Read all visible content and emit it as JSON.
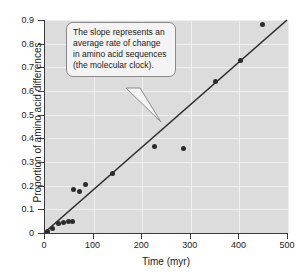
{
  "chart_data": {
    "type": "scatter",
    "title": "",
    "xlabel": "Time (myr)",
    "ylabel": "Proportion of amino acid differences",
    "xlim": [
      0,
      500
    ],
    "ylim": [
      0,
      0.9
    ],
    "grid": true,
    "legend": "none",
    "x_ticks": [
      "0",
      "100",
      "200",
      "300",
      "400",
      "500"
    ],
    "x_tick_values": [
      0,
      100,
      200,
      300,
      400,
      500
    ],
    "y_ticks": [
      "0",
      "0.1",
      "0.2",
      "0.3",
      "0.4",
      "0.5",
      "0.6",
      "0.7",
      "0.8",
      "0.9"
    ],
    "y_tick_values": [
      0,
      0.1,
      0.2,
      0.3,
      0.4,
      0.5,
      0.6,
      0.7,
      0.8,
      0.9
    ],
    "points": [
      {
        "x": 8,
        "y": 0.008
      },
      {
        "x": 18,
        "y": 0.02
      },
      {
        "x": 30,
        "y": 0.04
      },
      {
        "x": 41,
        "y": 0.046
      },
      {
        "x": 51,
        "y": 0.05
      },
      {
        "x": 58,
        "y": 0.05
      },
      {
        "x": 60,
        "y": 0.185
      },
      {
        "x": 73,
        "y": 0.175
      },
      {
        "x": 85,
        "y": 0.205
      },
      {
        "x": 140,
        "y": 0.25
      },
      {
        "x": 228,
        "y": 0.365
      },
      {
        "x": 287,
        "y": 0.357
      },
      {
        "x": 353,
        "y": 0.642
      },
      {
        "x": 405,
        "y": 0.73
      },
      {
        "x": 450,
        "y": 0.882
      }
    ],
    "trendline": {
      "label": "molecular clock regression line",
      "x_start": 0,
      "y_start": 0.0,
      "x_end": 500,
      "y_end": 0.9,
      "slope": 0.0018,
      "intercept": 0.0
    },
    "annotations": [
      {
        "name": "slope-callout",
        "text": "The slope represents an average rate of change in amino acid sequences (the molecular clock).",
        "points_to_x": 240,
        "points_to_y": 0.43
      }
    ],
    "colors": {
      "plot_background": "#dcdcdc",
      "gridline": "#f0f0f0",
      "point": "#2b2b2b",
      "trendline": "#2b2b2b",
      "axis": "#3b3b3b",
      "callout_background": "#f4f4f4",
      "callout_border": "#8a8a8a",
      "text": "#1a1a1a"
    }
  }
}
